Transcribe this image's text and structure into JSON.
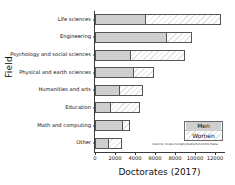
{
  "chart_data": {
    "type": "bar",
    "orientation": "horizontal",
    "stacked": true,
    "title": "",
    "xlabel": "Doctorates (2017)",
    "ylabel": "Field",
    "xlim": [
      0,
      12900
    ],
    "xticks": [
      0,
      2000,
      4000,
      6000,
      8000,
      10000,
      12000
    ],
    "xtick_labels": [
      "0",
      "2000",
      "4000",
      "6000",
      "8000",
      "10000",
      "12000"
    ],
    "grid": false,
    "legend_position": "lower right",
    "categories": [
      "Life sciences",
      "Engineering",
      "Psychology and social sciences",
      "Physical and earth sciences",
      "Humanities and arts",
      "Education",
      "Math and computing",
      "Other"
    ],
    "series": [
      {
        "name": "Men",
        "values": [
          5100,
          7200,
          3600,
          3900,
          2500,
          1600,
          2800,
          1400
        ]
      },
      {
        "name": "Women",
        "values": [
          7500,
          2500,
          5400,
          2000,
          2300,
          2900,
          700,
          1300
        ]
      }
    ],
    "totals": [
      12600,
      9700,
      9000,
      5900,
      4800,
      4500,
      3500,
      2700
    ],
    "annotations": [
      {
        "name": "source-note",
        "text": "Source: ncses.nsf.gov/pubs/nsf19301/data"
      }
    ]
  },
  "legend": {
    "items": [
      {
        "label": "Men",
        "swatch": "men"
      },
      {
        "label": "Women",
        "swatch": "women"
      }
    ]
  },
  "colors": {
    "men": "#cfcfcf",
    "women": "#ffffff",
    "bar_border": "#555555",
    "axis": "#3a3a3a",
    "text": "#111111",
    "background": "#ffffff"
  }
}
